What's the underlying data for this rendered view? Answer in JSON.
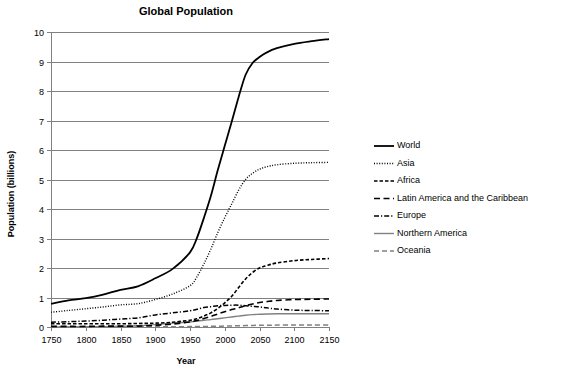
{
  "chart_data": {
    "type": "line",
    "title": "Global Population",
    "xlabel": "Year",
    "ylabel": "Population (billions)",
    "xlim": [
      1750,
      2150
    ],
    "ylim": [
      0,
      10
    ],
    "xticks": [
      1750,
      1800,
      1850,
      1900,
      1950,
      2000,
      2050,
      2100,
      2150
    ],
    "yticks": [
      0,
      1,
      2,
      3,
      4,
      5,
      6,
      7,
      8,
      9,
      10
    ],
    "grid": "horizontal",
    "legend_position": "right",
    "x": [
      1750,
      1775,
      1800,
      1825,
      1850,
      1875,
      1900,
      1925,
      1950,
      1960,
      1970,
      1980,
      1990,
      2000,
      2010,
      2020,
      2030,
      2040,
      2050,
      2060,
      2075,
      2100,
      2125,
      2150
    ],
    "series": [
      {
        "name": "World",
        "style": "solid",
        "color": "#000000",
        "width": 1.8,
        "values": [
          0.79,
          0.9,
          0.98,
          1.1,
          1.26,
          1.38,
          1.65,
          1.97,
          2.53,
          3.02,
          3.7,
          4.44,
          5.32,
          6.14,
          6.96,
          7.8,
          8.55,
          8.95,
          9.15,
          9.3,
          9.45,
          9.6,
          9.69,
          9.76
        ]
      },
      {
        "name": "Asia",
        "style": "dotted",
        "color": "#000000",
        "width": 1.4,
        "values": [
          0.5,
          0.56,
          0.62,
          0.68,
          0.75,
          0.79,
          0.93,
          1.12,
          1.4,
          1.7,
          2.14,
          2.64,
          3.2,
          3.71,
          4.17,
          4.64,
          5.0,
          5.21,
          5.35,
          5.43,
          5.5,
          5.55,
          5.57,
          5.58
        ]
      },
      {
        "name": "Africa",
        "style": "dashed-short",
        "color": "#000000",
        "width": 1.6,
        "values": [
          0.11,
          0.11,
          0.11,
          0.11,
          0.11,
          0.12,
          0.13,
          0.16,
          0.23,
          0.28,
          0.37,
          0.48,
          0.63,
          0.82,
          1.04,
          1.34,
          1.63,
          1.85,
          2.0,
          2.08,
          2.17,
          2.25,
          2.29,
          2.32
        ]
      },
      {
        "name": "Latin America and the Caribbean",
        "style": "dashed-long",
        "color": "#000000",
        "width": 1.6,
        "values": [
          0.02,
          0.02,
          0.02,
          0.03,
          0.03,
          0.03,
          0.06,
          0.1,
          0.17,
          0.22,
          0.29,
          0.36,
          0.44,
          0.52,
          0.59,
          0.65,
          0.72,
          0.78,
          0.83,
          0.86,
          0.9,
          0.93,
          0.94,
          0.95
        ]
      },
      {
        "name": "Europe",
        "style": "dash-dot",
        "color": "#000000",
        "width": 1.5,
        "values": [
          0.16,
          0.18,
          0.2,
          0.23,
          0.27,
          0.31,
          0.41,
          0.48,
          0.55,
          0.6,
          0.66,
          0.69,
          0.72,
          0.73,
          0.74,
          0.74,
          0.72,
          0.7,
          0.68,
          0.65,
          0.61,
          0.57,
          0.56,
          0.55
        ]
      },
      {
        "name": "Northern America",
        "style": "solid",
        "color": "#808080",
        "width": 1.4,
        "values": [
          0.002,
          0.004,
          0.007,
          0.013,
          0.026,
          0.045,
          0.082,
          0.13,
          0.17,
          0.2,
          0.23,
          0.25,
          0.28,
          0.31,
          0.34,
          0.37,
          0.4,
          0.42,
          0.43,
          0.44,
          0.45,
          0.45,
          0.45,
          0.45
        ]
      },
      {
        "name": "Oceania",
        "style": "dashed-gray",
        "color": "#808080",
        "width": 1.5,
        "values": [
          0.002,
          0.002,
          0.002,
          0.002,
          0.002,
          0.003,
          0.006,
          0.009,
          0.013,
          0.016,
          0.019,
          0.023,
          0.027,
          0.031,
          0.036,
          0.042,
          0.048,
          0.053,
          0.057,
          0.06,
          0.064,
          0.068,
          0.07,
          0.071
        ]
      }
    ]
  },
  "legend": {
    "items": [
      {
        "label": "World"
      },
      {
        "label": "Asia"
      },
      {
        "label": "Africa"
      },
      {
        "label": "Latin America and the Caribbean"
      },
      {
        "label": "Europe"
      },
      {
        "label": "Northern America"
      },
      {
        "label": "Oceania"
      }
    ]
  }
}
